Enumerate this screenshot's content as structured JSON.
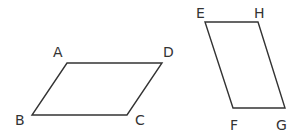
{
  "diagram": {
    "stroke_color": "#333333",
    "background": "#ffffff",
    "shapes": [
      {
        "name": "parallelogram-ABCD",
        "vertices": [
          {
            "label": "A",
            "x": 67,
            "y": 63,
            "lx": 53,
            "ly": 57
          },
          {
            "label": "D",
            "x": 162,
            "y": 63,
            "lx": 163,
            "ly": 57
          },
          {
            "label": "C",
            "x": 127,
            "y": 115,
            "lx": 135,
            "ly": 125
          },
          {
            "label": "B",
            "x": 32,
            "y": 115,
            "lx": 15,
            "ly": 125
          }
        ]
      },
      {
        "name": "parallelogram-EFGH",
        "vertices": [
          {
            "label": "E",
            "x": 205,
            "y": 22,
            "lx": 196,
            "ly": 18
          },
          {
            "label": "H",
            "x": 258,
            "y": 22,
            "lx": 254,
            "ly": 18
          },
          {
            "label": "G",
            "x": 285,
            "y": 108,
            "lx": 276,
            "ly": 130
          },
          {
            "label": "F",
            "x": 233,
            "y": 108,
            "lx": 230,
            "ly": 130
          }
        ]
      }
    ]
  }
}
